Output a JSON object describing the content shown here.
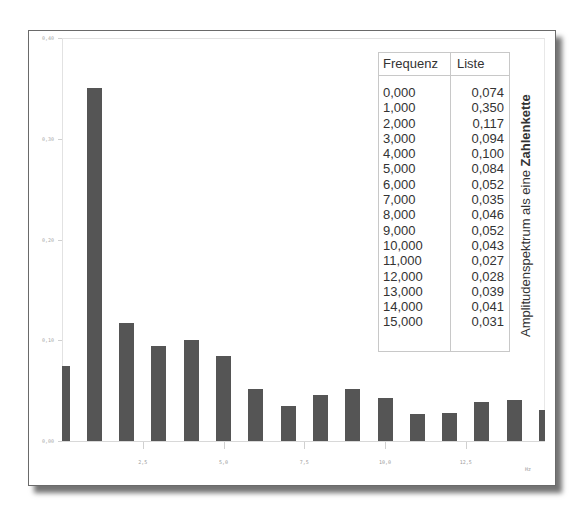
{
  "chart_data": {
    "type": "bar",
    "title": "Amplitudenspektrum als eine Zahlenkette",
    "xlabel": "Hz",
    "ylabel": "",
    "x": [
      0,
      1,
      2,
      3,
      4,
      5,
      6,
      7,
      8,
      9,
      10,
      11,
      12,
      13,
      14,
      15
    ],
    "values": [
      0.074,
      0.35,
      0.117,
      0.094,
      0.1,
      0.084,
      0.052,
      0.035,
      0.046,
      0.052,
      0.043,
      0.027,
      0.028,
      0.039,
      0.041,
      0.031
    ],
    "ylim": [
      0.0,
      0.4
    ],
    "xlim": [
      0,
      15
    ],
    "y_ticks": [
      "0,00",
      "0,10",
      "0,20",
      "0,30",
      "0,40"
    ],
    "x_ticks": [
      "2,5",
      "5,0",
      "7,5",
      "10,0",
      "12,5"
    ],
    "grid": false,
    "bar_color": "#555555"
  },
  "table": {
    "headers": [
      "Frequenz",
      "Liste"
    ],
    "rows": [
      [
        "0,000",
        "0,074"
      ],
      [
        "1,000",
        "0,350"
      ],
      [
        "2,000",
        "0,117"
      ],
      [
        "3,000",
        "0,094"
      ],
      [
        "4,000",
        "0,100"
      ],
      [
        "5,000",
        "0,084"
      ],
      [
        "6,000",
        "0,052"
      ],
      [
        "7,000",
        "0,035"
      ],
      [
        "8,000",
        "0,046"
      ],
      [
        "9,000",
        "0,052"
      ],
      [
        "10,000",
        "0,043"
      ],
      [
        "11,000",
        "0,027"
      ],
      [
        "12,000",
        "0,028"
      ],
      [
        "13,000",
        "0,039"
      ],
      [
        "14,000",
        "0,041"
      ],
      [
        "15,000",
        "0,031"
      ]
    ]
  },
  "side_title": {
    "normal": "Amplitudenspektrum als eine ",
    "bold": "Zahlenkette"
  },
  "x_unit": "Hz"
}
